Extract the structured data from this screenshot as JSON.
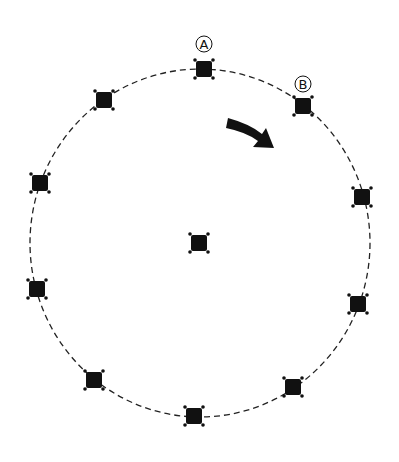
{
  "diagram": {
    "circle": {
      "cx": 200,
      "cy": 243,
      "rx": 170,
      "ry": 174,
      "stroke": "#222222",
      "dash": "6 4"
    },
    "center_marker": {
      "x": 199,
      "y": 243
    },
    "markers": [
      {
        "id": "A",
        "x": 204,
        "y": 69
      },
      {
        "id": "B",
        "x": 303,
        "y": 106
      },
      {
        "id": "m3",
        "x": 362,
        "y": 197
      },
      {
        "id": "m4",
        "x": 358,
        "y": 304
      },
      {
        "id": "m5",
        "x": 293,
        "y": 387
      },
      {
        "id": "m6",
        "x": 194,
        "y": 416
      },
      {
        "id": "m7",
        "x": 94,
        "y": 380
      },
      {
        "id": "m8",
        "x": 37,
        "y": 289
      },
      {
        "id": "m9",
        "x": 40,
        "y": 183
      },
      {
        "id": "m10",
        "x": 104,
        "y": 100
      }
    ],
    "labels": [
      {
        "text": "A",
        "x": 204,
        "y": 44
      },
      {
        "text": "B",
        "x": 303,
        "y": 84
      }
    ],
    "arrow": {
      "direction": "clockwise",
      "color": "#111111"
    }
  }
}
